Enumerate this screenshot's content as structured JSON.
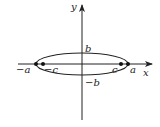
{
  "diagram": {
    "type": "ellipse-on-axes",
    "axes": {
      "x_label": "x",
      "y_label": "y"
    },
    "ellipse": {
      "center": [
        0,
        0
      ],
      "semi_major": "a",
      "semi_minor": "b",
      "orientation": "horizontal"
    },
    "vertex_labels": {
      "right": "a",
      "left": "−a",
      "top": "b",
      "bottom": "−b"
    },
    "foci_labels": {
      "right": "c",
      "left": "−c"
    },
    "colors": {
      "stroke": "#222222",
      "background": "#ffffff"
    }
  }
}
